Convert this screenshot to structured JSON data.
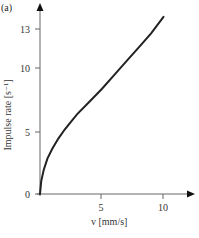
{
  "panel_label": "(a)",
  "chart_data": {
    "type": "line",
    "title": "",
    "xlabel": "v [mm/s]",
    "ylabel": "Impulse rate [s⁻¹]",
    "xticks": [
      5,
      10
    ],
    "yticks": [
      0,
      5,
      10,
      13
    ],
    "xlim": [
      0,
      12.4
    ],
    "ylim": [
      0,
      15
    ],
    "grid": false,
    "legend": null,
    "series": [
      {
        "name": "Impulse rate",
        "color": "#222222",
        "x": [
          0,
          0.1,
          0.3,
          0.6,
          1.0,
          1.5,
          2.0,
          2.5,
          3.0,
          4.0,
          5.0,
          6.0,
          7.0,
          8.0,
          9.0,
          10.0
        ],
        "y": [
          0,
          1.0,
          1.9,
          2.8,
          3.6,
          4.4,
          5.1,
          5.7,
          6.3,
          7.3,
          8.3,
          9.4,
          10.5,
          11.6,
          12.7,
          14.0
        ]
      }
    ]
  },
  "axes": {
    "ytick_labels": [
      "0",
      "5",
      "10",
      "13"
    ],
    "xtick_labels": [
      "5",
      "10"
    ],
    "xlabel": "v [mm/s]",
    "ylabel": "Impulse rate [s⁻¹]"
  }
}
